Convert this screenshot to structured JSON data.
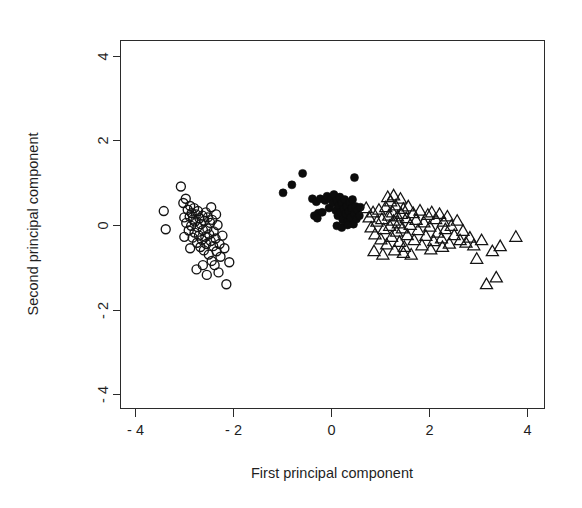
{
  "figure": {
    "type": "scatter-plot",
    "background_color": "#ffffff",
    "foreground_color": "#1a1a1a",
    "width": 582,
    "height": 508
  },
  "chart_data": {
    "type": "scatter",
    "title": "",
    "subtitle": "",
    "xlabel": "First principal component",
    "ylabel": "Second principal component",
    "xlim": [
      -4.6,
      4.4
    ],
    "ylim": [
      -4.4,
      4.4
    ],
    "grid": false,
    "legend": null,
    "legend_position": "none",
    "x_ticks": [
      -4,
      -2,
      0,
      2,
      4
    ],
    "x_tick_labels": [
      "- 4",
      "- 2",
      "0",
      "2",
      "4"
    ],
    "y_ticks": [
      -4,
      -2,
      0,
      2,
      4
    ],
    "y_tick_labels": [
      "- 4",
      "- 2",
      "0",
      "2",
      "4"
    ],
    "frame": "box",
    "series": [
      {
        "name": "Group 1",
        "marker": "open-circle",
        "marker_color": "#141414",
        "marker_fill": "none",
        "marker_size": 9,
        "points": [
          [
            -3.42,
            0.33
          ],
          [
            -3.38,
            -0.1
          ],
          [
            -3.07,
            0.91
          ],
          [
            -3.02,
            0.52
          ],
          [
            -3.0,
            0.18
          ],
          [
            -2.97,
            0.62
          ],
          [
            -2.96,
            0.05
          ],
          [
            -2.93,
            0.36
          ],
          [
            -2.91,
            -0.13
          ],
          [
            -2.89,
            0.2
          ],
          [
            -2.88,
            0.45
          ],
          [
            -2.86,
            -0.02
          ],
          [
            -2.85,
            0.28
          ],
          [
            -2.83,
            -0.3
          ],
          [
            -2.82,
            0.13
          ],
          [
            -2.8,
            0.4
          ],
          [
            -2.79,
            -0.18
          ],
          [
            -2.78,
            0.08
          ],
          [
            -2.76,
            0.25
          ],
          [
            -2.74,
            -0.42
          ],
          [
            -2.73,
            -0.05
          ],
          [
            -2.72,
            0.33
          ],
          [
            -2.7,
            -0.25
          ],
          [
            -2.69,
            0.16
          ],
          [
            -2.67,
            -0.52
          ],
          [
            -2.66,
            0.02
          ],
          [
            -2.64,
            -0.35
          ],
          [
            -2.63,
            0.22
          ],
          [
            -2.62,
            -0.12
          ],
          [
            -2.6,
            -0.6
          ],
          [
            -2.59,
            0.1
          ],
          [
            -2.57,
            -0.28
          ],
          [
            -2.56,
            0.3
          ],
          [
            -2.55,
            -0.45
          ],
          [
            -2.53,
            -0.08
          ],
          [
            -2.52,
            0.18
          ],
          [
            -2.5,
            -0.7
          ],
          [
            -2.49,
            -0.22
          ],
          [
            -2.47,
            0.05
          ],
          [
            -2.46,
            -0.38
          ],
          [
            -2.44,
            -0.85
          ],
          [
            -2.43,
            0.12
          ],
          [
            -2.41,
            -0.5
          ],
          [
            -2.4,
            -0.15
          ],
          [
            -2.38,
            -0.95
          ],
          [
            -2.36,
            -0.32
          ],
          [
            -2.34,
            -0.62
          ],
          [
            -2.32,
            0.0
          ],
          [
            -2.3,
            -1.12
          ],
          [
            -2.28,
            -0.45
          ],
          [
            -2.26,
            -0.75
          ],
          [
            -2.22,
            -0.25
          ],
          [
            -2.18,
            -0.55
          ],
          [
            -2.14,
            -1.4
          ],
          [
            -2.08,
            -0.88
          ],
          [
            -2.54,
            -1.18
          ],
          [
            -2.62,
            -0.95
          ],
          [
            -2.88,
            -0.55
          ],
          [
            -3.0,
            -0.28
          ],
          [
            -2.75,
            -1.05
          ],
          [
            -2.45,
            0.42
          ],
          [
            -2.35,
            0.25
          ]
        ]
      },
      {
        "name": "Group 2",
        "marker": "filled-circle",
        "marker_color": "#0c0c0c",
        "marker_fill": "#0c0c0c",
        "marker_size": 8,
        "points": [
          [
            -0.98,
            0.76
          ],
          [
            -0.8,
            0.95
          ],
          [
            -0.58,
            1.22
          ],
          [
            0.48,
            1.12
          ],
          [
            -0.38,
            0.62
          ],
          [
            -0.3,
            0.55
          ],
          [
            -0.26,
            0.28
          ],
          [
            -0.22,
            0.62
          ],
          [
            -0.18,
            0.3
          ],
          [
            -0.12,
            0.58
          ],
          [
            -0.08,
            0.68
          ],
          [
            -0.04,
            0.4
          ],
          [
            0.0,
            0.62
          ],
          [
            0.04,
            0.52
          ],
          [
            0.06,
            0.72
          ],
          [
            0.1,
            0.34
          ],
          [
            0.12,
            0.58
          ],
          [
            0.14,
            0.22
          ],
          [
            0.16,
            0.46
          ],
          [
            0.18,
            0.66
          ],
          [
            0.2,
            0.3
          ],
          [
            0.22,
            0.52
          ],
          [
            0.24,
            0.12
          ],
          [
            0.26,
            0.38
          ],
          [
            0.28,
            0.6
          ],
          [
            0.3,
            0.26
          ],
          [
            0.32,
            0.44
          ],
          [
            0.34,
            0.08
          ],
          [
            0.36,
            0.32
          ],
          [
            0.38,
            0.54
          ],
          [
            0.4,
            0.18
          ],
          [
            0.42,
            0.4
          ],
          [
            0.44,
            0.6
          ],
          [
            0.46,
            0.02
          ],
          [
            0.48,
            0.26
          ],
          [
            0.5,
            0.44
          ],
          [
            0.52,
            0.14
          ],
          [
            0.54,
            0.34
          ],
          [
            0.58,
            0.22
          ],
          [
            0.6,
            0.42
          ],
          [
            0.12,
            -0.02
          ],
          [
            0.22,
            -0.06
          ],
          [
            0.34,
            0.0
          ],
          [
            -0.34,
            0.22
          ],
          [
            -0.28,
            0.16
          ]
        ]
      },
      {
        "name": "Group 3",
        "marker": "open-triangle",
        "marker_color": "#141414",
        "marker_fill": "none",
        "marker_size": 11,
        "points": [
          [
            0.72,
            0.4
          ],
          [
            0.78,
            0.18
          ],
          [
            0.82,
            -0.06
          ],
          [
            0.86,
            0.3
          ],
          [
            0.9,
            -0.22
          ],
          [
            0.94,
            0.08
          ],
          [
            0.98,
            0.36
          ],
          [
            1.02,
            -0.34
          ],
          [
            1.04,
            0.14
          ],
          [
            1.08,
            -0.1
          ],
          [
            1.12,
            0.42
          ],
          [
            1.14,
            -0.46
          ],
          [
            1.18,
            0.22
          ],
          [
            1.2,
            -0.02
          ],
          [
            1.22,
            0.56
          ],
          [
            1.24,
            -0.28
          ],
          [
            1.26,
            0.3
          ],
          [
            1.28,
            0.1
          ],
          [
            1.3,
            -0.6
          ],
          [
            1.32,
            0.46
          ],
          [
            1.34,
            -0.16
          ],
          [
            1.36,
            0.2
          ],
          [
            1.38,
            0.04
          ],
          [
            1.4,
            -0.4
          ],
          [
            1.42,
            0.62
          ],
          [
            1.44,
            0.26
          ],
          [
            1.46,
            -0.08
          ],
          [
            1.48,
            0.38
          ],
          [
            1.5,
            -0.52
          ],
          [
            1.54,
            0.16
          ],
          [
            1.56,
            -0.24
          ],
          [
            1.58,
            0.44
          ],
          [
            1.62,
            0.0
          ],
          [
            1.64,
            -0.7
          ],
          [
            1.68,
            0.28
          ],
          [
            1.7,
            -0.36
          ],
          [
            1.74,
            0.12
          ],
          [
            1.78,
            -0.12
          ],
          [
            1.82,
            0.34
          ],
          [
            1.86,
            -0.48
          ],
          [
            1.9,
            0.06
          ],
          [
            1.94,
            -0.26
          ],
          [
            1.98,
            0.24
          ],
          [
            2.02,
            -0.04
          ],
          [
            2.06,
            0.3
          ],
          [
            2.1,
            -0.38
          ],
          [
            2.14,
            0.14
          ],
          [
            2.18,
            -0.18
          ],
          [
            2.22,
            0.26
          ],
          [
            2.26,
            -0.32
          ],
          [
            2.3,
            0.08
          ],
          [
            2.34,
            -0.1
          ],
          [
            2.38,
            0.2
          ],
          [
            2.42,
            -0.44
          ],
          [
            2.46,
            -0.02
          ],
          [
            2.52,
            -0.24
          ],
          [
            2.58,
            0.1
          ],
          [
            2.64,
            -0.36
          ],
          [
            2.7,
            -0.14
          ],
          [
            2.76,
            -0.42
          ],
          [
            2.84,
            -0.3
          ],
          [
            2.92,
            -0.48
          ],
          [
            2.98,
            -0.8
          ],
          [
            3.08,
            -0.36
          ],
          [
            3.18,
            -1.4
          ],
          [
            3.3,
            -0.62
          ],
          [
            3.38,
            -1.24
          ],
          [
            3.46,
            -0.5
          ],
          [
            3.78,
            -0.28
          ],
          [
            1.16,
            0.66
          ],
          [
            1.28,
            0.7
          ],
          [
            0.88,
            -0.62
          ],
          [
            1.06,
            -0.7
          ],
          [
            1.48,
            -0.66
          ],
          [
            2.04,
            -0.58
          ],
          [
            2.28,
            -0.52
          ]
        ]
      }
    ]
  },
  "axis": {
    "x_title": "First principal component",
    "y_title": "Second principal component",
    "x_tick_labels": [
      "- 4",
      "- 2",
      "0",
      "2",
      "4"
    ],
    "y_tick_labels": [
      "4",
      "2",
      "0",
      "- 2",
      "- 4"
    ]
  }
}
